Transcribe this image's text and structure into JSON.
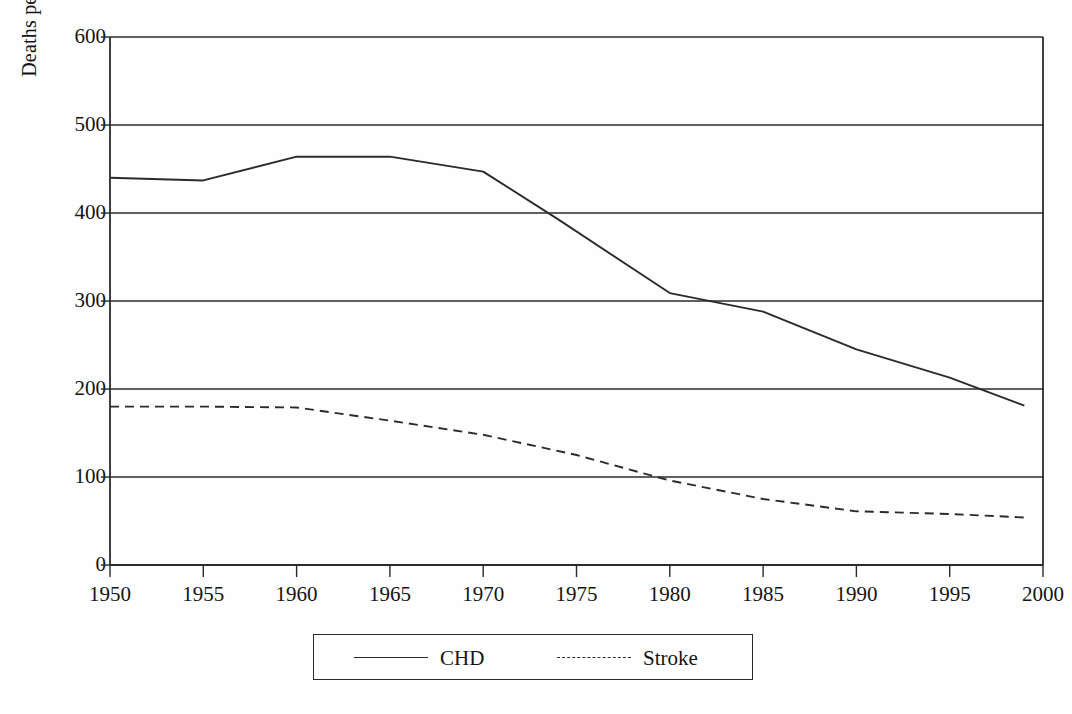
{
  "chart_data": {
    "type": "line",
    "title": "",
    "xlabel": "",
    "ylabel": "Deaths per 100,000 Population",
    "xlim": [
      1950,
      2000
    ],
    "ylim": [
      0,
      600
    ],
    "grid": true,
    "grid_axis": "y",
    "legend_position": "bottom",
    "x_ticks": [
      "1950",
      "1955",
      "1960",
      "1965",
      "1970",
      "1975",
      "1980",
      "1985",
      "1990",
      "1995",
      "2000"
    ],
    "y_ticks": [
      "0",
      "100",
      "200",
      "300",
      "400",
      "500",
      "600"
    ],
    "series": [
      {
        "name": "CHD",
        "style": "solid",
        "color": "#2b2b2b",
        "x": [
          1950,
          1955,
          1960,
          1965,
          1970,
          1974,
          1980,
          1985,
          1990,
          1995,
          1999
        ],
        "values": [
          440,
          437,
          464,
          464,
          447,
          393,
          309,
          288,
          245,
          213,
          181
        ]
      },
      {
        "name": "Stroke",
        "style": "dashed",
        "color": "#2b2b2b",
        "x": [
          1950,
          1955,
          1960,
          1965,
          1970,
          1975,
          1980,
          1985,
          1990,
          1995,
          1999
        ],
        "values": [
          180,
          180,
          179,
          164,
          148,
          125,
          96,
          75,
          61,
          58,
          54
        ]
      }
    ]
  },
  "axis": {
    "y_title": "Deaths per 100,000 Population"
  },
  "legend": {
    "items": [
      {
        "label": "CHD",
        "style": "solid"
      },
      {
        "label": "Stroke",
        "style": "dashed"
      }
    ]
  }
}
